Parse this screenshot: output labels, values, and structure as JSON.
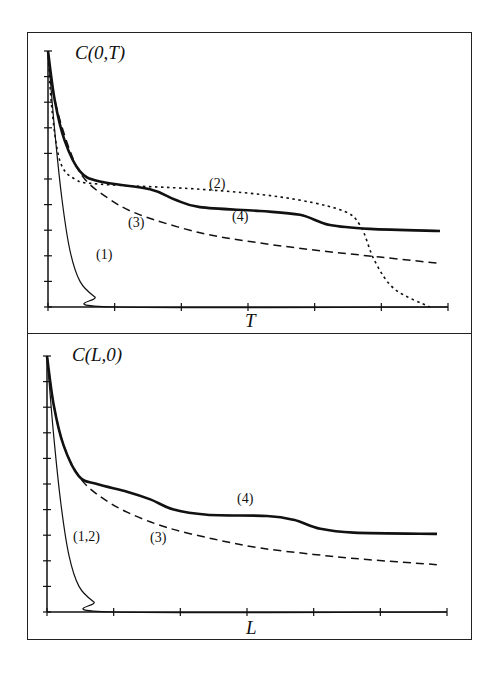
{
  "chart_data": [
    {
      "type": "line",
      "title": "C(0,T)",
      "xlabel": "T",
      "ylabel": "",
      "xlim": [
        0,
        6
      ],
      "ylim": [
        0,
        1
      ],
      "x_ticks": 7,
      "y_ticks": 11,
      "grid": false,
      "legend": "inline curve labels",
      "series": [
        {
          "name": "(1)",
          "style": "solid-thin",
          "x": [
            0,
            0.1,
            0.21,
            0.33,
            0.48,
            0.7,
            1.0,
            6.0
          ],
          "y": [
            1.0,
            0.69,
            0.42,
            0.22,
            0.1,
            0.04,
            0.0,
            0.0
          ]
        },
        {
          "name": "(2)",
          "style": "dotted",
          "x": [
            0,
            0.06,
            0.18,
            0.4,
            0.78,
            2.28,
            3.48,
            4.38,
            4.68,
            4.9,
            5.2,
            5.73
          ],
          "y": [
            1.0,
            0.77,
            0.57,
            0.5,
            0.48,
            0.46,
            0.43,
            0.38,
            0.32,
            0.18,
            0.07,
            0.0
          ]
        },
        {
          "name": "(3)",
          "style": "dashed",
          "x": [
            0,
            0.1,
            0.33,
            0.55,
            0.93,
            1.38,
            2.28,
            3.18,
            4.08,
            4.98,
            5.88
          ],
          "y": [
            1.0,
            0.81,
            0.61,
            0.5,
            0.42,
            0.36,
            0.29,
            0.25,
            0.22,
            0.195,
            0.17
          ]
        },
        {
          "name": "(4)",
          "style": "solid-thick",
          "x": [
            0,
            0.1,
            0.25,
            0.48,
            0.78,
            1.53,
            1.9,
            2.28,
            3.18,
            3.78,
            4.23,
            4.83,
            5.88
          ],
          "y": [
            1.0,
            0.81,
            0.65,
            0.53,
            0.49,
            0.46,
            0.42,
            0.39,
            0.375,
            0.36,
            0.32,
            0.305,
            0.297
          ]
        }
      ],
      "annotations": [
        {
          "text": "(1)",
          "x": 0.75,
          "y": 0.2
        },
        {
          "text": "(2)",
          "x": 2.45,
          "y": 0.5
        },
        {
          "text": "(3)",
          "x": 1.25,
          "y": 0.28
        },
        {
          "text": "(4)",
          "x": 2.75,
          "y": 0.34
        }
      ]
    },
    {
      "type": "line",
      "title": "C(L,0)",
      "xlabel": "L",
      "ylabel": "",
      "xlim": [
        0,
        6
      ],
      "ylim": [
        0,
        1
      ],
      "x_ticks": 7,
      "y_ticks": 11,
      "grid": false,
      "legend": "inline curve labels",
      "series": [
        {
          "name": "(1,2)",
          "style": "solid-thin",
          "x": [
            0,
            0.1,
            0.21,
            0.33,
            0.48,
            0.7,
            1.0,
            6.0
          ],
          "y": [
            1.0,
            0.69,
            0.42,
            0.22,
            0.1,
            0.04,
            0.0,
            0.0
          ]
        },
        {
          "name": "(3)",
          "style": "dashed",
          "x": [
            0,
            0.1,
            0.25,
            0.48,
            0.75,
            1.2,
            1.8,
            2.5,
            3.2,
            4.0,
            4.8,
            5.85
          ],
          "y": [
            1.0,
            0.81,
            0.65,
            0.53,
            0.46,
            0.39,
            0.33,
            0.285,
            0.25,
            0.225,
            0.205,
            0.185
          ]
        },
        {
          "name": "(4)",
          "style": "solid-thick",
          "x": [
            0,
            0.1,
            0.25,
            0.48,
            0.75,
            1.2,
            1.55,
            1.9,
            2.4,
            3.3,
            3.7,
            4.1,
            4.6,
            5.85
          ],
          "y": [
            1.0,
            0.81,
            0.65,
            0.53,
            0.5,
            0.47,
            0.44,
            0.4,
            0.38,
            0.375,
            0.36,
            0.325,
            0.31,
            0.305
          ]
        }
      ],
      "annotations": [
        {
          "text": "(1,2)",
          "x": 0.45,
          "y": 0.28
        },
        {
          "text": "(3)",
          "x": 1.55,
          "y": 0.27
        },
        {
          "text": "(4)",
          "x": 2.85,
          "y": 0.43
        }
      ]
    }
  ],
  "panels": {
    "top": {
      "title": "C(0,T)",
      "xlabel": "T",
      "labels": [
        "(1)",
        "(2)",
        "(3)",
        "(4)"
      ]
    },
    "bottom": {
      "title": "C(L,0)",
      "xlabel": "L",
      "labels": [
        "(1,2)",
        "(3)",
        "(4)"
      ]
    }
  },
  "colors": {
    "ink": "#111111",
    "frame": "#222222",
    "background": "#ffffff"
  }
}
